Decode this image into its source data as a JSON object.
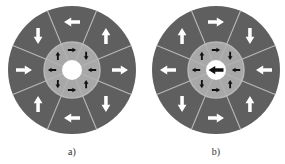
{
  "figure": {
    "panels": [
      {
        "label": "a)",
        "outer_arrows": [
          "left",
          "up",
          "right",
          "down",
          "left",
          "up",
          "right",
          "down"
        ],
        "inner_arrows": [
          "right",
          "down",
          "left",
          "up",
          "right",
          "down",
          "left",
          "up"
        ],
        "center_arrow": null
      },
      {
        "label": "b)",
        "outer_arrows": [
          "right",
          "down",
          "left",
          "up",
          "right",
          "down",
          "left",
          "up"
        ],
        "inner_arrows": [
          "right",
          "down",
          "left",
          "up",
          "right",
          "down",
          "left",
          "up"
        ],
        "center_arrow": "left"
      }
    ],
    "colors": {
      "outer_ring": "#5f5f5f",
      "inner_ring": "#a8a8a8",
      "divider": "#b8b8b8",
      "outer_arrow": "#ffffff",
      "inner_arrow": "#111111",
      "center": "#ffffff"
    }
  }
}
